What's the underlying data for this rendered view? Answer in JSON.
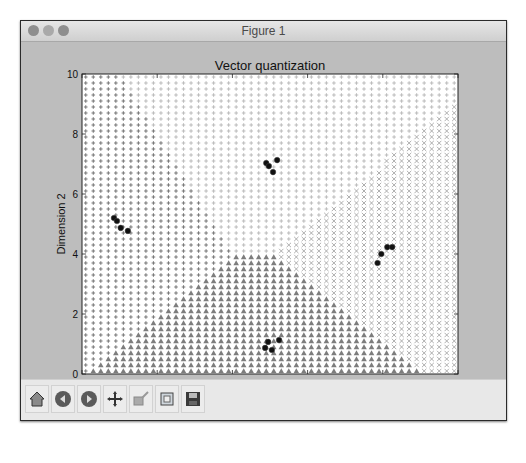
{
  "window": {
    "title": "Figure 1"
  },
  "toolbar": {
    "buttons": [
      {
        "name": "home-button",
        "icon": "home-icon",
        "label": "Home"
      },
      {
        "name": "back-button",
        "icon": "back-arrow-icon",
        "label": "Back"
      },
      {
        "name": "forward-button",
        "icon": "forward-arrow-icon",
        "label": "Forward"
      },
      {
        "name": "pan-button",
        "icon": "move-icon",
        "label": "Pan"
      },
      {
        "name": "zoom-button",
        "icon": "zoom-rect-icon",
        "label": "Zoom"
      },
      {
        "name": "subplots-button",
        "icon": "subplots-icon",
        "label": "Configure subplots"
      },
      {
        "name": "save-button",
        "icon": "save-icon",
        "label": "Save"
      }
    ]
  },
  "colors": {
    "region_left": "#7a7a7a",
    "region_top": "#bdbdbd",
    "region_right": "#9a9a9a",
    "region_bottom": "#7d7d7d",
    "points": "#111111"
  },
  "chart_data": {
    "type": "scatter",
    "title": "Vector quantization",
    "xlabel": "Dimension 1",
    "ylabel": "Dimension 2",
    "xlim": [
      0,
      10
    ],
    "ylim": [
      0,
      10
    ],
    "xticks": [
      0,
      2,
      4,
      6,
      8,
      10
    ],
    "yticks": [
      0,
      2,
      4,
      6,
      8,
      10
    ],
    "grid": false,
    "legend": null,
    "background_grid": {
      "description": "Grid of points colored/marked by nearest centroid (Voronoi regions)",
      "step": 0.2,
      "start": 0.1,
      "end": 9.9
    },
    "centroids": [
      {
        "name": "left",
        "x": 1.0,
        "y": 4.98,
        "marker": "+",
        "color_key": "region_left"
      },
      {
        "name": "top",
        "x": 5.04,
        "y": 6.96,
        "marker": "+",
        "color_key": "region_top"
      },
      {
        "name": "right",
        "x": 8.05,
        "y": 4.04,
        "marker": "x",
        "color_key": "region_right"
      },
      {
        "name": "bottom",
        "x": 5.03,
        "y": 0.97,
        "marker": "^",
        "color_key": "region_bottom"
      }
    ],
    "series": [
      {
        "name": "cluster-left",
        "points": [
          [
            0.85,
            5.2
          ],
          [
            0.93,
            5.1
          ],
          [
            1.03,
            4.87
          ],
          [
            1.22,
            4.77
          ]
        ]
      },
      {
        "name": "cluster-top",
        "points": [
          [
            4.9,
            7.03
          ],
          [
            4.97,
            6.93
          ],
          [
            5.19,
            7.13
          ],
          [
            5.08,
            6.73
          ]
        ]
      },
      {
        "name": "cluster-right",
        "points": [
          [
            8.12,
            4.23
          ],
          [
            8.25,
            4.23
          ],
          [
            7.96,
            4.0
          ],
          [
            7.86,
            3.7
          ]
        ]
      },
      {
        "name": "cluster-bottom",
        "points": [
          [
            4.95,
            1.07
          ],
          [
            4.87,
            0.87
          ],
          [
            5.05,
            0.8
          ],
          [
            5.24,
            1.13
          ]
        ]
      }
    ]
  }
}
